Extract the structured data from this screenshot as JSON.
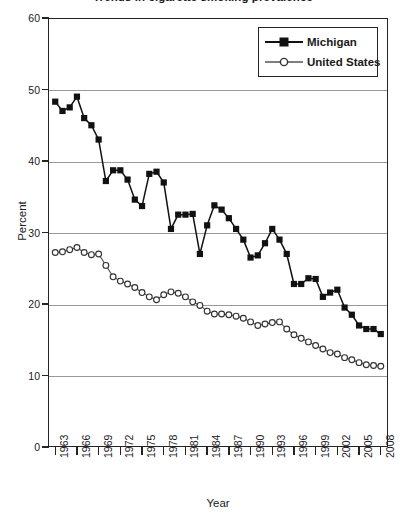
{
  "figure": {
    "title_clipped": "Trends in cigarette smoking prevalence",
    "xlabel": "Year",
    "ylabel": "Percent"
  },
  "legend": {
    "position": "top-right",
    "entries": [
      {
        "label": "Michigan",
        "marker": "filled-square",
        "color": "#111111"
      },
      {
        "label": "United States",
        "marker": "open-circle",
        "color": "#555555"
      }
    ]
  },
  "chart_data": {
    "type": "line",
    "title": "Trends in cigarette smoking prevalence",
    "xlabel": "Year",
    "ylabel": "Percent",
    "xlim": [
      1962,
      2009
    ],
    "ylim": [
      0,
      60
    ],
    "ytick_values": [
      0,
      10,
      20,
      30,
      40,
      50,
      60
    ],
    "ytick_labels": [
      "0",
      "10",
      "20",
      "30",
      "40",
      "50",
      "60"
    ],
    "xtick_values": [
      1963,
      1966,
      1969,
      1972,
      1975,
      1978,
      1981,
      1984,
      1987,
      1990,
      1993,
      1996,
      1999,
      2002,
      2005,
      2008
    ],
    "xtick_labels": [
      "1963",
      "1966",
      "1969",
      "1972",
      "1975",
      "1978",
      "1981",
      "1984",
      "1987",
      "1990",
      "1993",
      "1996",
      "1999",
      "2002",
      "2005",
      "2008"
    ],
    "grid": "horizontal",
    "legend_position": "top-right",
    "series": [
      {
        "name": "Michigan",
        "marker": "filled-square",
        "color": "#111111",
        "x": [
          1963,
          1964,
          1965,
          1966,
          1967,
          1968,
          1969,
          1970,
          1971,
          1972,
          1973,
          1974,
          1975,
          1976,
          1977,
          1978,
          1979,
          1980,
          1981,
          1982,
          1983,
          1984,
          1985,
          1986,
          1987,
          1988,
          1989,
          1990,
          1991,
          1992,
          1993,
          1994,
          1995,
          1996,
          1997,
          1998,
          1999,
          2000,
          2001,
          2002,
          2003,
          2004,
          2005,
          2006,
          2007,
          2008
        ],
        "y": [
          48.3,
          47.0,
          47.5,
          49.0,
          46.0,
          45.0,
          43.0,
          37.2,
          38.7,
          38.7,
          37.4,
          34.6,
          33.7,
          38.2,
          38.5,
          37.0,
          30.5,
          32.5,
          32.5,
          32.6,
          27.0,
          31.0,
          33.8,
          33.2,
          32.0,
          30.5,
          29.0,
          26.5,
          26.8,
          28.5,
          30.5,
          29.0,
          27.0,
          22.8,
          22.8,
          23.6,
          23.5,
          21.0,
          21.6,
          22.0,
          19.5,
          18.5,
          17.0,
          16.5,
          16.5,
          15.8
        ]
      },
      {
        "name": "United States",
        "marker": "open-circle",
        "color": "#555555",
        "x": [
          1963,
          1964,
          1965,
          1966,
          1967,
          1968,
          1969,
          1970,
          1971,
          1972,
          1973,
          1974,
          1975,
          1976,
          1977,
          1978,
          1979,
          1980,
          1981,
          1982,
          1983,
          1984,
          1985,
          1986,
          1987,
          1988,
          1989,
          1990,
          1991,
          1992,
          1993,
          1994,
          1995,
          1996,
          1997,
          1998,
          1999,
          2000,
          2001,
          2002,
          2003,
          2004,
          2005,
          2006,
          2007,
          2008
        ],
        "y": [
          27.2,
          27.3,
          27.6,
          27.9,
          27.2,
          26.9,
          27.0,
          25.4,
          23.8,
          23.2,
          22.8,
          22.3,
          21.6,
          21.0,
          20.6,
          21.3,
          21.7,
          21.5,
          21.0,
          20.3,
          19.8,
          19.0,
          18.6,
          18.6,
          18.5,
          18.3,
          18.0,
          17.5,
          17.0,
          17.2,
          17.4,
          17.5,
          16.5,
          15.7,
          15.2,
          14.7,
          14.2,
          13.7,
          13.2,
          13.0,
          12.5,
          12.2,
          11.8,
          11.5,
          11.4,
          11.3
        ]
      }
    ]
  }
}
